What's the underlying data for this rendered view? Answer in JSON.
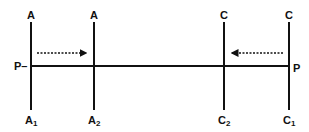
{
  "diagram": {
    "lines": [
      {
        "id": "A",
        "top_label": "A",
        "bottom_label": "A",
        "bottom_sub": "1",
        "x": 31
      },
      {
        "id": "A2",
        "top_label": "A",
        "bottom_label": "A",
        "bottom_sub": "2",
        "x": 94
      },
      {
        "id": "C2",
        "top_label": "C",
        "bottom_label": "C",
        "bottom_sub": "2",
        "x": 224
      },
      {
        "id": "C1",
        "top_label": "C",
        "bottom_label": "C",
        "bottom_sub": "1",
        "x": 289
      }
    ],
    "point_left_label": "P–",
    "point_right_label": "P",
    "arrow_left": {
      "direction": "right",
      "style": "dashed"
    },
    "arrow_right": {
      "direction": "left",
      "style": "dashed"
    },
    "colors": {
      "line": "#111111",
      "background": "#ffffff"
    }
  }
}
